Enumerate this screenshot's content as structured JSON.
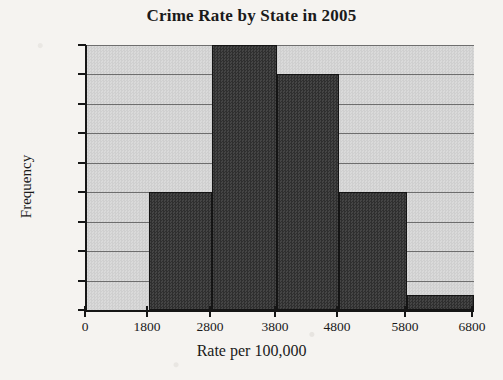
{
  "chart_data": {
    "type": "bar",
    "title": "Crime Rate by State in 2005",
    "xlabel": "Rate per 100,000",
    "ylabel": "Frequency",
    "categories": [
      "1800-2800",
      "2800-3800",
      "3800-4800",
      "4800-5800",
      "5800-6800"
    ],
    "values": [
      8,
      18,
      16,
      8,
      1
    ],
    "bins": [
      {
        "label": "1800-2800",
        "start": 1800,
        "end": 2800,
        "value": 8
      },
      {
        "label": "2800-3800",
        "start": 2800,
        "end": 3800,
        "value": 18
      },
      {
        "label": "3800-4800",
        "start": 3800,
        "end": 4800,
        "value": 16
      },
      {
        "label": "4800-5800",
        "start": 4800,
        "end": 5800,
        "value": 8
      },
      {
        "label": "5800-6800",
        "start": 5800,
        "end": 6800,
        "value": 1
      }
    ],
    "xlim": [
      0,
      6800
    ],
    "ylim": [
      0,
      18
    ],
    "xticks": [
      0,
      1800,
      2800,
      3800,
      4800,
      5800,
      6800
    ],
    "xtick_labels": [
      "0",
      "1800",
      "2800",
      "3800",
      "4800",
      "5800",
      "6800"
    ],
    "yticks": [
      0,
      2,
      4,
      6,
      8,
      10,
      12,
      14,
      16,
      18
    ],
    "ytick_labels": [
      "0",
      "2",
      "4",
      "6",
      "8",
      "10",
      "12",
      "14",
      "16",
      "18"
    ],
    "grid": true,
    "legend": null,
    "colors": {
      "page_background": "#f5f3f0",
      "plot_background": "#d5d5d5",
      "bar_fill": "#3a3a3a",
      "bar_edge": "#141414",
      "gridline": "#6e6e6e",
      "axis": "#161616",
      "text": "#1a1a1a"
    }
  }
}
